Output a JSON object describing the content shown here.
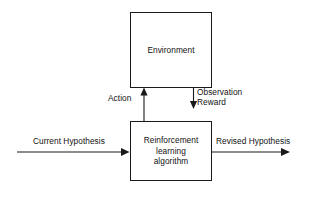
{
  "diagram": {
    "colors": {
      "stroke": "#1a1a1a",
      "text": "#111111",
      "background": "#ffffff"
    },
    "nodes": {
      "environment": {
        "label": "Environment",
        "lines": [
          "Environment"
        ]
      },
      "agent": {
        "label": "Reinforcement learning algorithm",
        "lines": [
          "Reinforcement",
          "learning",
          "algorithm"
        ]
      }
    },
    "edges": {
      "action": {
        "label": "Action",
        "from": "agent",
        "to": "environment",
        "direction": "up"
      },
      "observation_reward": {
        "label": "Observation Reward",
        "lines": [
          "Observation",
          "Reward"
        ],
        "from": "environment",
        "to": "agent",
        "direction": "down"
      },
      "current_hypothesis": {
        "label": "Current Hypothesis",
        "to": "agent",
        "direction": "right"
      },
      "revised_hypothesis": {
        "label": "Revised Hypothesis",
        "from": "agent",
        "direction": "right"
      }
    }
  }
}
